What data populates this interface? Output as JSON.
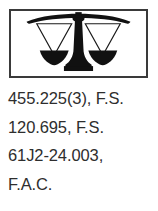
{
  "emblem": {
    "icon_name": "scales-of-justice-icon",
    "description": "Balance scales of justice inside a rectangular frame",
    "frame_color": "#3a3a3a",
    "fill_color": "#111111",
    "background_color": "#ffffff"
  },
  "citations": {
    "lines": [
      "455.225(3), F.S.",
      "120.695, F.S.",
      "61J2-24.003,",
      "F.A.C."
    ]
  },
  "colors": {
    "text": "#2e2e2e",
    "page_background": "#ffffff"
  }
}
